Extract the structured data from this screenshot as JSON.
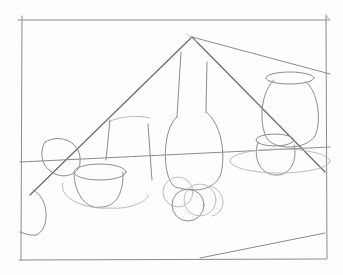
{
  "image": {
    "description": "Pencil still-life sketch with construction lines",
    "subjects": [
      "tall bottle",
      "vase",
      "bowl",
      "cup",
      "small jar",
      "fruits",
      "table plane"
    ],
    "colors": {
      "paper": "#fdfdfd",
      "graphite_dark": "#6a6a6a",
      "graphite_mid": "#8c8c8c",
      "graphite_light": "#b4b4b4"
    }
  }
}
